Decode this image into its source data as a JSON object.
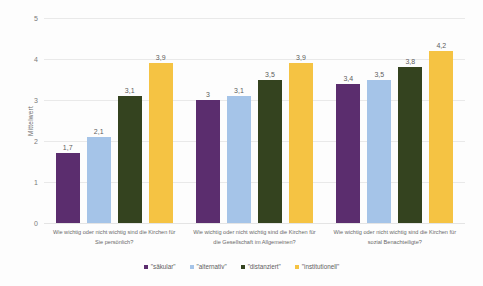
{
  "chart_data": {
    "type": "bar",
    "title": "",
    "xlabel": "",
    "ylabel": "Mittelwert",
    "ylim": [
      0,
      5
    ],
    "yticks": [
      "0",
      "1",
      "2",
      "3",
      "4",
      "5"
    ],
    "grid": true,
    "legend_position": "bottom",
    "categories": [
      "Wie wichtig oder nicht wichtig sind die Kirchen für Sie persönlich?",
      "Wie wichtig oder nicht wichtig sind die Kirchen für die Gesellschaft im Allgemeinen?",
      "Wie wichtig oder nicht wichtig sind die Kirchen für sozial Benachteiligte?"
    ],
    "series": [
      {
        "name": "\"säkular\"",
        "color": "#5B2D6E",
        "values": [
          1.7,
          3.0,
          3.4
        ],
        "labels": [
          "1,7",
          "3",
          "3,4"
        ]
      },
      {
        "name": "\"alternativ\"",
        "color": "#A5C4E8",
        "values": [
          2.1,
          3.1,
          3.5
        ],
        "labels": [
          "2,1",
          "3,1",
          "3,5"
        ]
      },
      {
        "name": "\"distanziert\"",
        "color": "#34431F",
        "values": [
          3.1,
          3.5,
          3.8
        ],
        "labels": [
          "3,1",
          "3,5",
          "3,8"
        ]
      },
      {
        "name": "\"institutionell\"",
        "color": "#F5C343",
        "values": [
          3.9,
          3.9,
          4.2
        ],
        "labels": [
          "3,9",
          "3,9",
          "4,2"
        ]
      }
    ]
  }
}
